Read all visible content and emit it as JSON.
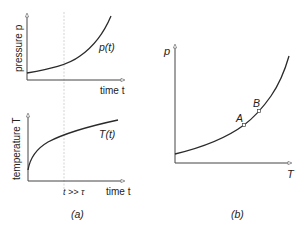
{
  "panel_a": {
    "caption": "(a)",
    "top_plot": {
      "ylabel": "pressure p",
      "xlabel": "time t",
      "curve_label": "p(t)"
    },
    "bottom_plot": {
      "ylabel": "temperature T",
      "xlabel": "time t",
      "curve_label": "T(t)",
      "marker_label": "t >> τ"
    }
  },
  "panel_b": {
    "caption": "(b)",
    "ylabel": "p",
    "xlabel": "T",
    "points": [
      {
        "label": "A"
      },
      {
        "label": "B"
      }
    ]
  },
  "colors": {
    "curve": "#2a2a2a",
    "axis": "#333333",
    "dashed": "#bbbbbb",
    "text": "#222222"
  }
}
